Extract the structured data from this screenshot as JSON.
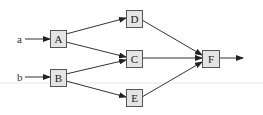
{
  "diagram": {
    "type": "directed-graph",
    "inputs": [
      {
        "id": "a",
        "label": "a",
        "x": 19,
        "y": 39,
        "target": "A"
      },
      {
        "id": "b",
        "label": "b",
        "x": 19,
        "y": 77,
        "target": "B"
      }
    ],
    "nodes": [
      {
        "id": "A",
        "label": "A",
        "x": 50,
        "y": 30,
        "w": 16,
        "h": 17
      },
      {
        "id": "B",
        "label": "B",
        "x": 50,
        "y": 69,
        "w": 16,
        "h": 17
      },
      {
        "id": "D",
        "label": "D",
        "x": 126,
        "y": 10,
        "w": 16,
        "h": 17
      },
      {
        "id": "C",
        "label": "C",
        "x": 126,
        "y": 50,
        "w": 16,
        "h": 17
      },
      {
        "id": "E",
        "label": "E",
        "x": 126,
        "y": 89,
        "w": 16,
        "h": 17
      },
      {
        "id": "F",
        "label": "F",
        "x": 202,
        "y": 50,
        "w": 17,
        "h": 17
      }
    ],
    "edges": [
      {
        "from": "a",
        "to": "A"
      },
      {
        "from": "b",
        "to": "B"
      },
      {
        "from": "A",
        "to": "D"
      },
      {
        "from": "A",
        "to": "C"
      },
      {
        "from": "B",
        "to": "C"
      },
      {
        "from": "B",
        "to": "E"
      },
      {
        "from": "D",
        "to": "F"
      },
      {
        "from": "C",
        "to": "F"
      },
      {
        "from": "E",
        "to": "F"
      },
      {
        "from": "F",
        "to": "output"
      }
    ],
    "output": {
      "x_end": 243,
      "y": 58
    },
    "colors": {
      "box_fill": "#e4e4e4",
      "box_stroke": "#555555",
      "edge": "#333333",
      "background_rule": "#e6e6e6"
    }
  }
}
